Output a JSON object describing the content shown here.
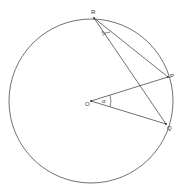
{
  "diagram": {
    "type": "circle-geometry",
    "circle": {
      "cx": 91,
      "cy": 101,
      "r": 82
    },
    "points": {
      "R": {
        "label": "R",
        "x": 94,
        "y": 18
      },
      "P": {
        "label": "P",
        "x": 168,
        "y": 77
      },
      "Q": {
        "label": "Q",
        "x": 166,
        "y": 124
      },
      "O": {
        "label": "O",
        "x": 91,
        "y": 101
      }
    },
    "segments": [
      [
        "R",
        "P"
      ],
      [
        "R",
        "Q"
      ],
      [
        "O",
        "P"
      ],
      [
        "O",
        "Q"
      ]
    ],
    "angles": {
      "at_O": {
        "label": "α"
      },
      "at_R": {
        "label": "α/2"
      }
    },
    "colors": {
      "stroke": "#333333",
      "background": "#ffffff"
    }
  }
}
